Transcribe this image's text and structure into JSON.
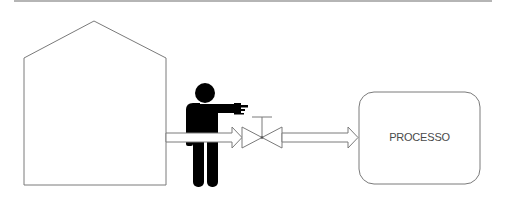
{
  "diagram": {
    "type": "process-flow",
    "colors": {
      "outline": "#7a7a7a",
      "figure": "#000000",
      "rule": "#b5b5b5",
      "label": "#4a4a4a"
    },
    "nodes": [
      {
        "id": "source",
        "shape": "house",
        "label": ""
      },
      {
        "id": "operator",
        "shape": "person-pointing",
        "label": ""
      },
      {
        "id": "valve",
        "shape": "gate-valve",
        "label": ""
      },
      {
        "id": "process",
        "shape": "rounded-rectangle",
        "label": "PROCESSO"
      }
    ],
    "edges": [
      {
        "from": "source",
        "to": "valve",
        "style": "double-line-arrow"
      },
      {
        "from": "valve",
        "to": "process",
        "style": "double-line-arrow"
      }
    ]
  },
  "process_box": {
    "label": "PROCESSO"
  }
}
